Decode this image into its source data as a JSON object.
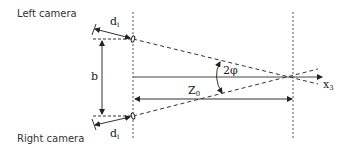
{
  "labels": {
    "left_camera": "Left camera",
    "right_camera": "Right camera",
    "baseline": "b",
    "focal_top": "d",
    "focal_top_sub": "i",
    "focal_bottom": "d",
    "focal_bottom_sub": "i",
    "distance": "Z",
    "distance_sub": "0",
    "angle": "2φ",
    "axis": "x",
    "axis_sub": "3"
  },
  "colors": {
    "line": "#222222",
    "dash": "#333333",
    "text": "#333333"
  }
}
